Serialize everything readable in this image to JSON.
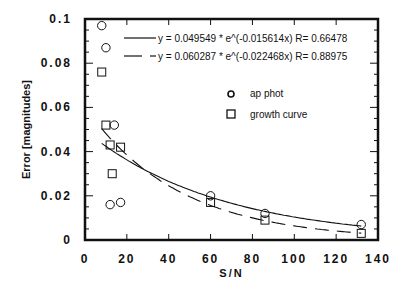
{
  "chart_data": {
    "type": "scatter",
    "title": "",
    "xlabel": "S/N",
    "ylabel": "Error  [magnitudes]",
    "xlim": [
      0,
      140
    ],
    "ylim": [
      0,
      0.1
    ],
    "x_ticks": [
      "0",
      "20",
      "40",
      "60",
      "80",
      "100",
      "120",
      "140"
    ],
    "y_ticks": [
      "0",
      "0.02",
      "0.04",
      "0.06",
      "0.08",
      "0.1"
    ],
    "grid": false,
    "legend_position": "upper right",
    "series": [
      {
        "name": "ap phot",
        "marker": "circle",
        "points": [
          [
            8,
            0.097
          ],
          [
            10,
            0.087
          ],
          [
            14,
            0.052
          ],
          [
            12,
            0.016
          ],
          [
            17,
            0.017
          ],
          [
            60,
            0.02
          ],
          [
            86,
            0.012
          ],
          [
            132,
            0.007
          ]
        ]
      },
      {
        "name": "growth curve",
        "marker": "square",
        "points": [
          [
            8,
            0.076
          ],
          [
            10,
            0.052
          ],
          [
            12,
            0.043
          ],
          [
            13,
            0.03
          ],
          [
            17,
            0.042
          ],
          [
            60,
            0.017
          ],
          [
            86,
            0.009
          ],
          [
            132,
            0.003
          ]
        ]
      }
    ],
    "fits": [
      {
        "label": "y = 0.049549 * e^(-0.015614x) R= 0.66478",
        "a": 0.049549,
        "b": -0.015614,
        "R": 0.66478,
        "style": "solid",
        "series": "ap phot"
      },
      {
        "label": "y = 0.060287 * e^(-0.022468x) R= 0.88975",
        "a": 0.060287,
        "b": -0.022468,
        "R": 0.88975,
        "style": "dashed",
        "series": "growth curve"
      }
    ]
  },
  "legend": {
    "fit1": "y = 0.049549 * e^(-0.015614x)  R= 0.66478",
    "fit2": "y = 0.060287 * e^(-0.022468x)  R= 0.88975",
    "marker1": "ap phot",
    "marker2": "growth curve"
  }
}
